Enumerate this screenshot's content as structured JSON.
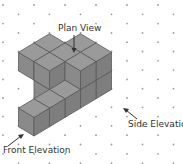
{
  "diagram": {
    "labels": {
      "plan": "Plan View",
      "side": "Side Elevation",
      "front": "Front Elevation"
    },
    "colors": {
      "top": "#9a9a9a",
      "left": "#8a8a8a",
      "right": "#7e7e7e",
      "edge": "#5a5a5a",
      "dot": "#9a9a9a",
      "arrow": "#333333"
    },
    "grid": {
      "dx": 15.5,
      "dy": 9.3,
      "cols": 12,
      "rows": 18
    },
    "cubes": [
      [
        0,
        0,
        0
      ],
      [
        1,
        0,
        0
      ],
      [
        2,
        0,
        0
      ],
      [
        2,
        1,
        0
      ],
      [
        2,
        1,
        1
      ],
      [
        3,
        0,
        0
      ],
      [
        3,
        0,
        1
      ],
      [
        3,
        1,
        0
      ],
      [
        3,
        1,
        1
      ],
      [
        2,
        2,
        1
      ],
      [
        3,
        2,
        1
      ],
      [
        4,
        0,
        0
      ],
      [
        4,
        0,
        1
      ],
      [
        4,
        1,
        0
      ],
      [
        4,
        1,
        1
      ]
    ]
  }
}
